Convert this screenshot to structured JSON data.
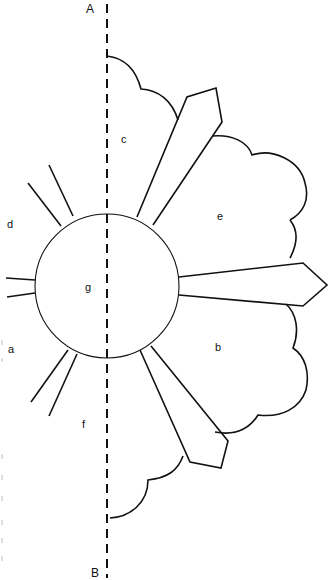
{
  "diagram": {
    "type": "pattern-template",
    "axis": {
      "top_label": "A",
      "bottom_label": "B",
      "style": "dashed"
    },
    "regions": [
      {
        "id": "c",
        "label": "c",
        "description": "upper cloud lobe"
      },
      {
        "id": "e",
        "label": "e",
        "description": "upper-right cloud lobe"
      },
      {
        "id": "b",
        "label": "b",
        "description": "lower-right cloud lobe"
      },
      {
        "id": "g",
        "label": "g",
        "description": "center circle"
      },
      {
        "id": "d",
        "label": "d",
        "description": "upper-left ray lines"
      },
      {
        "id": "a",
        "label": "a",
        "description": "left ray lines"
      },
      {
        "id": "f",
        "label": "f",
        "description": "lower-left ray lines"
      }
    ],
    "colors": {
      "line": "#111111",
      "background": "#ffffff"
    }
  }
}
